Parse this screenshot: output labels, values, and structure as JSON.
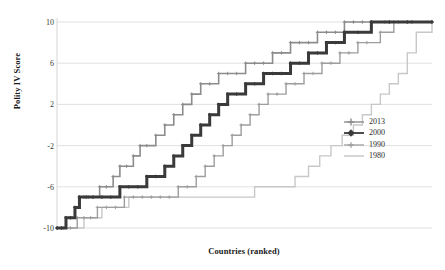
{
  "chart_data": {
    "type": "line",
    "title": "",
    "xlabel": "Countries (ranked)",
    "ylabel": "Polity IV Score",
    "ylim": [
      -10,
      10
    ],
    "xlim": [
      0,
      167
    ],
    "yticks": [
      10,
      6,
      2,
      -2,
      -6,
      -10
    ],
    "ytick_labels": [
      "10",
      "6",
      "2",
      "-2",
      "-6",
      "-10"
    ],
    "xticks": [],
    "xtick_labels": [],
    "grid": "horizontal",
    "legend_position": "center-right",
    "note": "Step chart: cumulative distribution of Polity IV scores across countries ranked from lowest to highest, for four years.",
    "series": [
      {
        "name": "2013",
        "color": "#8c8c8c",
        "line_width": 1.6,
        "marker": "plus",
        "x": [
          0,
          2,
          4,
          6,
          8,
          10,
          12,
          14,
          16,
          19,
          22,
          25,
          28,
          31,
          34,
          37,
          40,
          44,
          48,
          52,
          56,
          60,
          64,
          68,
          72,
          76,
          80,
          84,
          88,
          92,
          96,
          100,
          104,
          108,
          112,
          116,
          120,
          124,
          128,
          132,
          136,
          140,
          146,
          152,
          158,
          167
        ],
        "values": [
          -10,
          -10,
          -9,
          -9,
          -8,
          -7,
          -7,
          -7,
          -7,
          -6,
          -6,
          -5,
          -4,
          -4,
          -3,
          -2,
          -2,
          -1,
          0,
          1,
          2,
          3,
          4,
          4,
          5,
          5,
          5,
          6,
          6,
          6,
          7,
          7,
          8,
          8,
          8,
          9,
          9,
          9,
          10,
          10,
          10,
          10,
          10,
          10,
          10,
          10
        ]
      },
      {
        "name": "2000",
        "color": "#3a3a3a",
        "line_width": 3.0,
        "marker": "diamond",
        "x": [
          0,
          2,
          4,
          6,
          8,
          10,
          13,
          16,
          20,
          24,
          28,
          32,
          36,
          40,
          44,
          48,
          52,
          56,
          60,
          64,
          68,
          72,
          76,
          80,
          84,
          88,
          92,
          96,
          100,
          104,
          108,
          112,
          116,
          120,
          124,
          128,
          134,
          140,
          148,
          156,
          167
        ],
        "values": [
          -10,
          -10,
          -9,
          -9,
          -8,
          -7,
          -7,
          -7,
          -7,
          -7,
          -6,
          -6,
          -6,
          -5,
          -5,
          -4,
          -3,
          -2,
          -1,
          0,
          1,
          2,
          3,
          3,
          4,
          4,
          5,
          5,
          5,
          6,
          6,
          7,
          7,
          8,
          8,
          9,
          9,
          10,
          10,
          10,
          10
        ]
      },
      {
        "name": "1990",
        "color": "#9e9e9e",
        "line_width": 1.4,
        "marker": "plus",
        "x": [
          0,
          3,
          6,
          9,
          12,
          15,
          18,
          22,
          26,
          30,
          34,
          38,
          42,
          46,
          50,
          54,
          58,
          62,
          66,
          70,
          74,
          78,
          82,
          86,
          90,
          94,
          98,
          102,
          106,
          110,
          114,
          118,
          122,
          126,
          130,
          134,
          138,
          144,
          150,
          158,
          167
        ],
        "values": [
          -10,
          -10,
          -10,
          -9,
          -9,
          -9,
          -8,
          -8,
          -8,
          -7,
          -7,
          -7,
          -7,
          -7,
          -7,
          -6,
          -6,
          -5,
          -4,
          -3,
          -2,
          -1,
          0,
          1,
          2,
          3,
          3,
          4,
          4,
          5,
          5,
          6,
          6,
          7,
          7,
          8,
          8,
          9,
          10,
          10,
          10
        ]
      },
      {
        "name": "1980",
        "color": "#c8c8c8",
        "line_width": 1.4,
        "marker": "dash",
        "x": [
          0,
          4,
          8,
          12,
          16,
          20,
          26,
          32,
          40,
          50,
          60,
          70,
          80,
          88,
          94,
          100,
          106,
          112,
          117,
          122,
          127,
          132,
          136,
          140,
          144,
          148,
          152,
          156,
          160,
          167
        ],
        "values": [
          -10,
          -10,
          -10,
          -9,
          -9,
          -8,
          -8,
          -7,
          -7,
          -7,
          -7,
          -7,
          -7,
          -6,
          -6,
          -6,
          -5,
          -4,
          -3,
          -2,
          -1,
          0,
          1,
          2,
          3,
          4,
          5,
          7,
          9,
          10
        ]
      }
    ]
  },
  "legend": {
    "entries": [
      {
        "label": "2013"
      },
      {
        "label": "2000"
      },
      {
        "label": "1990"
      },
      {
        "label": "1980"
      }
    ]
  }
}
